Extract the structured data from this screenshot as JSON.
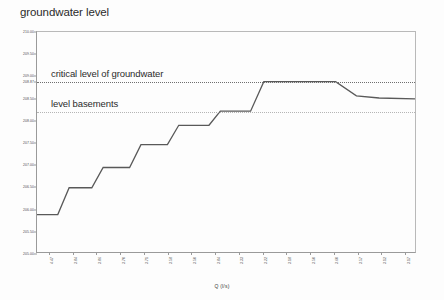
{
  "chart_data": {
    "type": "line",
    "title": "groundwater level",
    "xlabel": "Q (l/s)",
    "ylabel": "",
    "ylim": [
      205.0,
      210.0
    ],
    "yticks": [
      "210.00",
      "209.50",
      "209.00",
      "208.87",
      "208.50",
      "208.00",
      "207.50",
      "207.00",
      "206.50",
      "206.00",
      "205.50",
      "205.00"
    ],
    "ytick_values": [
      210.0,
      209.5,
      209.0,
      208.87,
      208.5,
      208.0,
      207.5,
      207.0,
      206.5,
      206.0,
      205.5,
      205.0
    ],
    "xtick_labels": [
      "4.47",
      "3.84",
      "3.86",
      "3.70",
      "3.71",
      "3.58",
      "3.50",
      "3.84",
      "3.33",
      "3.22",
      "3.18",
      "3.50",
      "3.60",
      "3.57",
      "3.12",
      "3.17"
    ],
    "grid": false,
    "legend": false,
    "annotations": [
      {
        "label": "critical level of groundwater",
        "value": 208.87
      },
      {
        "label": "level basements",
        "value": 208.2
      }
    ],
    "series": [
      {
        "name": "groundwater level",
        "color": "#595959",
        "points": [
          {
            "x": 0.0,
            "y": 205.85
          },
          {
            "x": 0.055,
            "y": 205.85
          },
          {
            "x": 0.085,
            "y": 206.46
          },
          {
            "x": 0.145,
            "y": 206.46
          },
          {
            "x": 0.175,
            "y": 206.92
          },
          {
            "x": 0.245,
            "y": 206.92
          },
          {
            "x": 0.275,
            "y": 207.44
          },
          {
            "x": 0.345,
            "y": 207.44
          },
          {
            "x": 0.375,
            "y": 207.88
          },
          {
            "x": 0.455,
            "y": 207.88
          },
          {
            "x": 0.485,
            "y": 208.2
          },
          {
            "x": 0.565,
            "y": 208.2
          },
          {
            "x": 0.6,
            "y": 208.87
          },
          {
            "x": 0.79,
            "y": 208.87
          },
          {
            "x": 0.845,
            "y": 208.55
          },
          {
            "x": 0.905,
            "y": 208.5
          },
          {
            "x": 1.0,
            "y": 208.48
          }
        ]
      }
    ]
  }
}
